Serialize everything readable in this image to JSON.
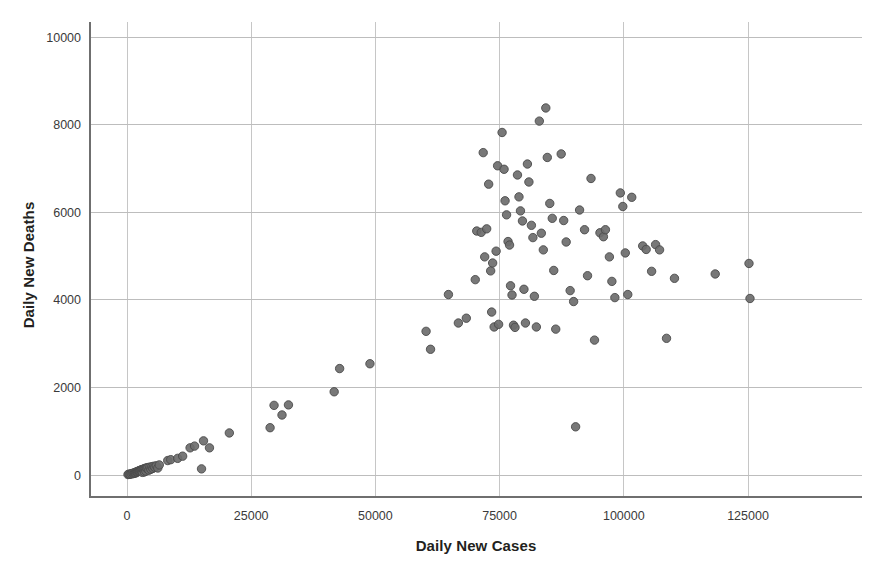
{
  "chart_data": {
    "type": "scatter",
    "title": "",
    "xlabel": "Daily New Cases",
    "ylabel": "Daily New Deaths",
    "xlim": [
      -5500,
      140000
    ],
    "ylim": [
      -900,
      10900
    ],
    "xticks": [
      0,
      25000,
      50000,
      75000,
      100000,
      125000
    ],
    "xtick_labels": [
      "0",
      "25000",
      "50000",
      "75000",
      "100000",
      "125000"
    ],
    "yticks": [
      0,
      2000,
      4000,
      6000,
      8000,
      10000
    ],
    "ytick_labels": [
      "0",
      "2000",
      "4000",
      "6000",
      "8000",
      "10000"
    ],
    "grid": true,
    "legend": "none",
    "marker": {
      "shape": "circle",
      "radius_px": 4.2,
      "fill_color": "#6d6d6d",
      "edge_color": "#4a4a4a",
      "opacity": 0.92
    },
    "n_points": 140,
    "series": [
      {
        "name": "Daily New Cases vs Daily New Deaths",
        "points": [
          [
            200,
            10
          ],
          [
            400,
            20
          ],
          [
            600,
            15
          ],
          [
            800,
            30
          ],
          [
            1000,
            25
          ],
          [
            1200,
            40
          ],
          [
            1400,
            35
          ],
          [
            1500,
            55
          ],
          [
            1600,
            45
          ],
          [
            1700,
            60
          ],
          [
            1800,
            50
          ],
          [
            1900,
            70
          ],
          [
            2000,
            65
          ],
          [
            2100,
            80
          ],
          [
            2200,
            75
          ],
          [
            2300,
            90
          ],
          [
            2400,
            85
          ],
          [
            2500,
            100
          ],
          [
            2600,
            95
          ],
          [
            2700,
            110
          ],
          [
            2800,
            105
          ],
          [
            2900,
            120
          ],
          [
            3000,
            115
          ],
          [
            3100,
            60
          ],
          [
            3200,
            130
          ],
          [
            3300,
            125
          ],
          [
            3400,
            140
          ],
          [
            3500,
            70
          ],
          [
            3600,
            150
          ],
          [
            3700,
            145
          ],
          [
            3800,
            90
          ],
          [
            3900,
            160
          ],
          [
            4000,
            155
          ],
          [
            4200,
            170
          ],
          [
            4400,
            110
          ],
          [
            4600,
            180
          ],
          [
            4800,
            130
          ],
          [
            5000,
            190
          ],
          [
            5200,
            150
          ],
          [
            5400,
            200
          ],
          [
            5600,
            175
          ],
          [
            5900,
            210
          ],
          [
            6200,
            160
          ],
          [
            6500,
            230
          ],
          [
            8200,
            330
          ],
          [
            8800,
            350
          ],
          [
            10200,
            380
          ],
          [
            11200,
            430
          ],
          [
            12700,
            620
          ],
          [
            13600,
            660
          ],
          [
            15000,
            140
          ],
          [
            15400,
            780
          ],
          [
            16600,
            620
          ],
          [
            20600,
            960
          ],
          [
            28800,
            1080
          ],
          [
            29600,
            1590
          ],
          [
            31200,
            1370
          ],
          [
            32500,
            1600
          ],
          [
            41700,
            1900
          ],
          [
            42800,
            2430
          ],
          [
            48900,
            2540
          ],
          [
            60200,
            3280
          ],
          [
            61100,
            2870
          ],
          [
            64700,
            4120
          ],
          [
            66700,
            3470
          ],
          [
            68300,
            3580
          ],
          [
            70100,
            4460
          ],
          [
            70400,
            5570
          ],
          [
            71300,
            5540
          ],
          [
            71700,
            7360
          ],
          [
            72000,
            4980
          ],
          [
            72400,
            5620
          ],
          [
            72800,
            6640
          ],
          [
            73200,
            4660
          ],
          [
            73400,
            3720
          ],
          [
            73600,
            4840
          ],
          [
            73900,
            3380
          ],
          [
            74300,
            5110
          ],
          [
            74600,
            7060
          ],
          [
            74800,
            3440
          ],
          [
            75500,
            7820
          ],
          [
            75900,
            6980
          ],
          [
            76100,
            6260
          ],
          [
            76400,
            5940
          ],
          [
            76700,
            5330
          ],
          [
            77000,
            5250
          ],
          [
            77200,
            4320
          ],
          [
            77500,
            4110
          ],
          [
            77800,
            3420
          ],
          [
            78100,
            3370
          ],
          [
            78600,
            6850
          ],
          [
            78900,
            6350
          ],
          [
            79200,
            6030
          ],
          [
            79600,
            5800
          ],
          [
            79900,
            4240
          ],
          [
            80200,
            3470
          ],
          [
            80600,
            7100
          ],
          [
            80900,
            6690
          ],
          [
            81400,
            5700
          ],
          [
            81700,
            5420
          ],
          [
            82000,
            4080
          ],
          [
            82400,
            3380
          ],
          [
            83000,
            8080
          ],
          [
            83400,
            5520
          ],
          [
            83800,
            5140
          ],
          [
            84300,
            8380
          ],
          [
            84600,
            7250
          ],
          [
            85100,
            6200
          ],
          [
            85600,
            5860
          ],
          [
            85900,
            4670
          ],
          [
            86300,
            3330
          ],
          [
            87400,
            7330
          ],
          [
            87900,
            5810
          ],
          [
            88400,
            5320
          ],
          [
            89200,
            4210
          ],
          [
            89900,
            3960
          ],
          [
            90300,
            1100
          ],
          [
            91100,
            6050
          ],
          [
            92100,
            5600
          ],
          [
            92700,
            4550
          ],
          [
            93400,
            6770
          ],
          [
            94100,
            3080
          ],
          [
            95200,
            5530
          ],
          [
            95900,
            5440
          ],
          [
            96300,
            5600
          ],
          [
            97100,
            4980
          ],
          [
            97600,
            4420
          ],
          [
            98200,
            4050
          ],
          [
            99300,
            6440
          ],
          [
            99800,
            6130
          ],
          [
            100300,
            5070
          ],
          [
            100800,
            4120
          ],
          [
            101600,
            6340
          ],
          [
            103800,
            5230
          ],
          [
            104500,
            5150
          ],
          [
            105600,
            4650
          ],
          [
            106400,
            5260
          ],
          [
            107200,
            5140
          ],
          [
            108600,
            3120
          ],
          [
            110200,
            4490
          ],
          [
            118400,
            4590
          ],
          [
            125200,
            4830
          ],
          [
            125400,
            4030
          ]
        ]
      }
    ]
  },
  "figure": {
    "background_color": "#ffffff",
    "grid_color": "#bdbdbd",
    "spine_color": "#6f6f6f",
    "text_color": "#231f20"
  }
}
